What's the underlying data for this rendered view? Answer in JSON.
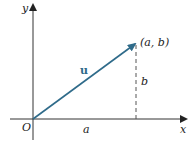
{
  "diagram": {
    "axis_x_label": "x",
    "axis_y_label": "y",
    "origin_label": "O",
    "vector_label": "u",
    "point_label": "(a, b)",
    "horizontal_component_label": "a",
    "vertical_component_label": "b",
    "colors": {
      "vector": "#2f6b8a",
      "axes": "#333333",
      "dashed": "#555555"
    }
  }
}
